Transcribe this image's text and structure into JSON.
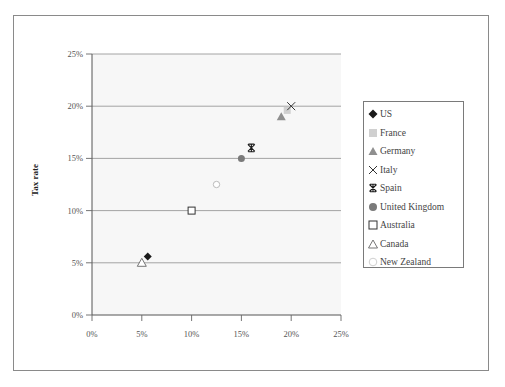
{
  "chart_data": {
    "type": "scatter",
    "title": "",
    "xlabel": "",
    "ylabel": "Tax rate",
    "xlim": [
      0,
      25
    ],
    "ylim": [
      0,
      25
    ],
    "x_ticks": [
      "0%",
      "5%",
      "10%",
      "15%",
      "20%",
      "25%"
    ],
    "y_ticks": [
      "0%",
      "5%",
      "10%",
      "15%",
      "20%",
      "25%"
    ],
    "grid": {
      "horizontal": true,
      "vertical": false
    },
    "legend_position": "right",
    "series": [
      {
        "name": "US",
        "marker": "filled-diamond",
        "color": "#1a1a1a",
        "x": 5.6,
        "y": 5.6
      },
      {
        "name": "France",
        "marker": "filled-square",
        "color": "#d0d0d0",
        "x": 19.6,
        "y": 19.6
      },
      {
        "name": "Germany",
        "marker": "filled-triangle",
        "color": "#8f8f8f",
        "x": 19.0,
        "y": 19.0
      },
      {
        "name": "Italy",
        "marker": "x-cross",
        "color": "#333333",
        "x": 20.0,
        "y": 20.0
      },
      {
        "name": "Spain",
        "marker": "asterisk",
        "color": "#1a1a1a",
        "x": 16.0,
        "y": 16.0
      },
      {
        "name": "United Kingdom",
        "marker": "filled-circle",
        "color": "#7a7a7a",
        "x": 15.0,
        "y": 15.0
      },
      {
        "name": "Australia",
        "marker": "open-square",
        "color": "#333333",
        "x": 10.0,
        "y": 10.0
      },
      {
        "name": "Canada",
        "marker": "open-triangle",
        "color": "#666666",
        "x": 5.0,
        "y": 5.0
      },
      {
        "name": "New Zealand",
        "marker": "open-circle",
        "color": "#bbbbbb",
        "x": 12.5,
        "y": 12.5
      }
    ]
  },
  "legend": {
    "items": [
      "US",
      "France",
      "Germany",
      "Italy",
      "Spain",
      "United Kingdom",
      "Australia",
      "Canada",
      "New Zealand"
    ]
  }
}
